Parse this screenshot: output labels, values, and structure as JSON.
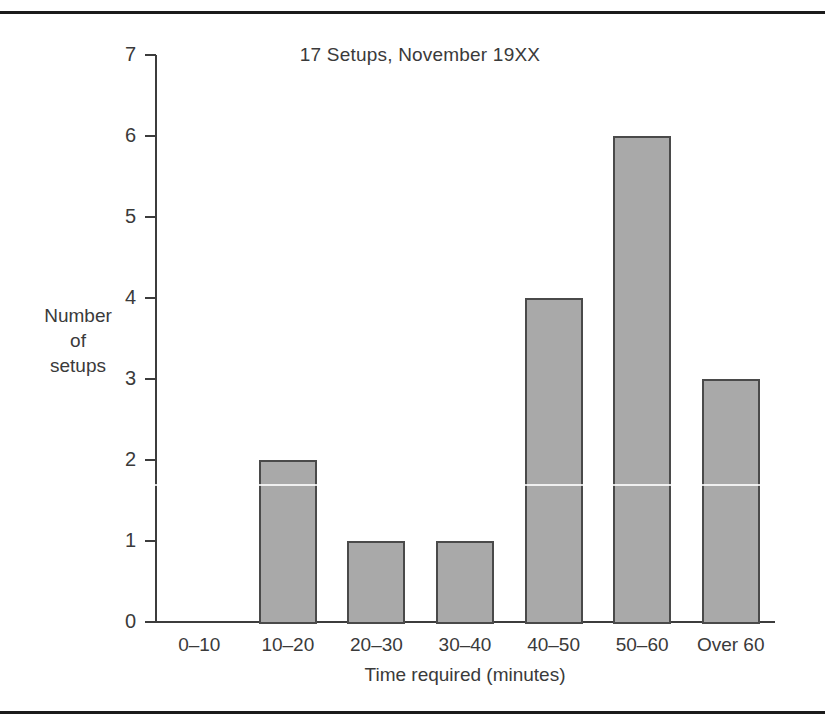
{
  "figure": {
    "background_color": "#ffffff",
    "rule_color": "#1b1b1b",
    "axis_color": "#3c3c3c",
    "bar_fill_color": "#a9a9a9",
    "bar_edge_color": "#4a4a4a",
    "text_color": "#3a3a3a"
  },
  "axis": {
    "y_title_lines": [
      "Number",
      "of",
      "setups"
    ],
    "x_title": "Time required (minutes)"
  },
  "chart_data": {
    "type": "bar",
    "title": "17 Setups, November 19XX",
    "xlabel": "Time required (minutes)",
    "ylabel": "Number of setups",
    "categories": [
      "0–10",
      "10–20",
      "20–30",
      "30–40",
      "40–50",
      "50–60",
      "Over 60"
    ],
    "values": [
      0,
      2,
      1,
      1,
      4,
      6,
      3
    ],
    "ylim": [
      0,
      7
    ],
    "ytick_labels": [
      "0",
      "1",
      "2",
      "3",
      "4",
      "5",
      "6",
      "7"
    ],
    "ytick_values": [
      0,
      1,
      2,
      3,
      4,
      5,
      6,
      7
    ],
    "grid": false,
    "legend": "none",
    "total": 17,
    "orientation": "vertical"
  }
}
